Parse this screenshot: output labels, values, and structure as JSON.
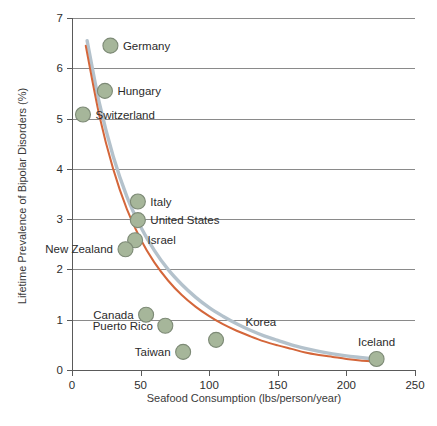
{
  "chart_data": {
    "type": "scatter",
    "title": "",
    "xlabel": "Seafood Consumption (lbs/person/year)",
    "ylabel": "Lifetime Prevalence of Bipolar Disorders (%)",
    "xlim": [
      0,
      250
    ],
    "ylim": [
      0,
      7
    ],
    "xticks": [
      0,
      50,
      100,
      150,
      200,
      250
    ],
    "yticks": [
      0,
      1,
      2,
      3,
      4,
      5,
      6,
      7
    ],
    "xtick_labels": [
      "0",
      "50",
      "100",
      "150",
      "200",
      "250"
    ],
    "ytick_labels": [
      "0",
      "1",
      "2",
      "3",
      "4",
      "5",
      "6",
      "7"
    ],
    "grid": "horizontal",
    "legend": "none",
    "marker_fill": "#a6b69a",
    "marker_edge": "#7d8a76",
    "points": [
      {
        "label": "Germany",
        "x": 28,
        "y": 6.45,
        "label_side": "right"
      },
      {
        "label": "Hungary",
        "x": 24,
        "y": 5.55,
        "label_side": "right"
      },
      {
        "label": "Switzerland",
        "x": 8,
        "y": 5.08,
        "label_side": "right"
      },
      {
        "label": "Italy",
        "x": 48,
        "y": 3.35,
        "label_side": "right"
      },
      {
        "label": "United States",
        "x": 48,
        "y": 2.98,
        "label_side": "right"
      },
      {
        "label": "Israel",
        "x": 46,
        "y": 2.58,
        "label_side": "right"
      },
      {
        "label": "New Zealand",
        "x": 39,
        "y": 2.4,
        "label_side": "left"
      },
      {
        "label": "Canada",
        "x": 54,
        "y": 1.1,
        "label_side": "left"
      },
      {
        "label": "Puerto Rico",
        "x": 68,
        "y": 0.88,
        "label_side": "left"
      },
      {
        "label": "Taiwan",
        "x": 81,
        "y": 0.36,
        "label_side": "left"
      },
      {
        "label": "Korea",
        "x": 105,
        "y": 0.6,
        "label_side": "upper-right"
      },
      {
        "label": "Iceland",
        "x": 222,
        "y": 0.22,
        "label_side": "above"
      }
    ],
    "series": [
      {
        "name": "fit-curve-blue",
        "color": "#b4c2cc",
        "type": "line",
        "x": [
          11,
          20,
          30,
          40,
          50,
          60,
          70,
          80,
          90,
          100,
          110,
          120,
          130,
          140,
          150,
          160,
          170,
          180,
          190,
          200,
          210,
          220,
          225
        ],
        "values": [
          6.55,
          5.3,
          4.25,
          3.45,
          2.85,
          2.38,
          2.0,
          1.7,
          1.45,
          1.24,
          1.07,
          0.92,
          0.79,
          0.68,
          0.59,
          0.5,
          0.43,
          0.37,
          0.32,
          0.28,
          0.25,
          0.22,
          0.21
        ]
      },
      {
        "name": "fit-curve-orange",
        "color": "#d4663a",
        "type": "line",
        "x": [
          10,
          20,
          30,
          40,
          50,
          60,
          70,
          80,
          90,
          100,
          110,
          120,
          130,
          140,
          150,
          160,
          170,
          180,
          190,
          200,
          210,
          220,
          225
        ],
        "values": [
          6.45,
          5.05,
          4.0,
          3.2,
          2.6,
          2.14,
          1.78,
          1.49,
          1.26,
          1.07,
          0.91,
          0.78,
          0.67,
          0.57,
          0.49,
          0.42,
          0.35,
          0.3,
          0.26,
          0.22,
          0.19,
          0.17,
          0.16
        ]
      }
    ]
  }
}
